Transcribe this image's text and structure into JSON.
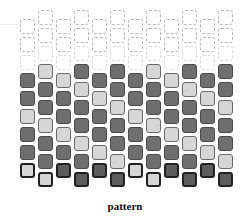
{
  "caption": "pattern",
  "colors": {
    "dark_fill": "#6e6e6e",
    "light_fill": "#d6d6d6",
    "dashed_outline": "#b8b8b8",
    "bottom_border": "#222222"
  },
  "layout": {
    "column_x": [
      20,
      38,
      56,
      74,
      92,
      110,
      128,
      146,
      164,
      182,
      200,
      218
    ],
    "row_step": 18,
    "cell_size": 15,
    "high_start_y": 64,
    "low_start_y": 73,
    "dashed_slots_per_column": 3
  },
  "columns": [
    {
      "index": 1,
      "offset": "low",
      "cells": [
        "dark",
        "dark",
        "light",
        "dark",
        "dark",
        "light"
      ]
    },
    {
      "index": 2,
      "offset": "high",
      "cells": [
        "light",
        "dark",
        "dark",
        "light",
        "dark",
        "dark",
        "light"
      ]
    },
    {
      "index": 3,
      "offset": "low",
      "cells": [
        "light",
        "dark",
        "dark",
        "light",
        "dark",
        "dark"
      ]
    },
    {
      "index": 4,
      "offset": "high",
      "cells": [
        "dark",
        "light",
        "dark",
        "dark",
        "light",
        "dark",
        "dark"
      ]
    },
    {
      "index": 5,
      "offset": "low",
      "cells": [
        "dark",
        "light",
        "dark",
        "dark",
        "light",
        "dark"
      ]
    },
    {
      "index": 6,
      "offset": "high",
      "cells": [
        "dark",
        "dark",
        "light",
        "dark",
        "dark",
        "light",
        "dark"
      ]
    },
    {
      "index": 7,
      "offset": "low",
      "cells": [
        "dark",
        "dark",
        "light",
        "dark",
        "dark",
        "light"
      ]
    },
    {
      "index": 8,
      "offset": "high",
      "cells": [
        "light",
        "dark",
        "dark",
        "light",
        "dark",
        "dark",
        "light"
      ]
    },
    {
      "index": 9,
      "offset": "low",
      "cells": [
        "light",
        "dark",
        "dark",
        "light",
        "dark",
        "dark"
      ]
    },
    {
      "index": 10,
      "offset": "high",
      "cells": [
        "dark",
        "light",
        "dark",
        "dark",
        "light",
        "dark",
        "dark"
      ]
    },
    {
      "index": 11,
      "offset": "low",
      "cells": [
        "dark",
        "light",
        "dark",
        "dark",
        "light",
        "dark"
      ]
    },
    {
      "index": 12,
      "offset": "high",
      "cells": [
        "dark",
        "dark",
        "light",
        "dark",
        "dark",
        "light",
        "dark"
      ]
    }
  ]
}
